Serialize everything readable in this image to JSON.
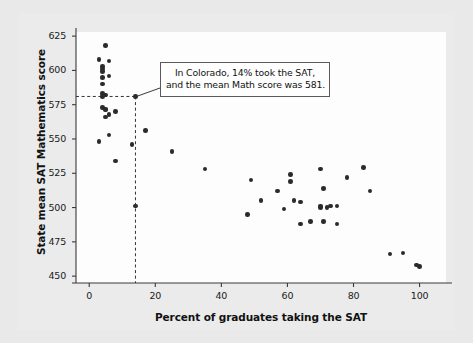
{
  "figure": {
    "background_color": "#e9e9e9",
    "panel_color": "#ebebeb",
    "plot_background_color": "#fdfdfd"
  },
  "annotation": {
    "name": "colorado-callout",
    "line1": "In Colorado, 14% took the SAT,",
    "line2": "and the mean Math score was 581.",
    "highlight_point": {
      "x": 14,
      "y": 581
    },
    "guide_style": "dashed",
    "guide_color": "#333333"
  },
  "chart_data": {
    "type": "scatter",
    "title": "",
    "xlabel": "Percent of graduates taking the SAT",
    "ylabel": "State mean SAT Mathematics score",
    "xlim": [
      -4,
      108
    ],
    "ylim": [
      445,
      628
    ],
    "xticks": [
      0,
      20,
      40,
      60,
      80,
      100
    ],
    "yticks": [
      450,
      475,
      500,
      525,
      550,
      575,
      600,
      625
    ],
    "grid": false,
    "legend": null,
    "marker_color": "#2b2b2b",
    "points": [
      {
        "x": 5,
        "y": 618
      },
      {
        "x": 3,
        "y": 608
      },
      {
        "x": 6,
        "y": 607
      },
      {
        "x": 4,
        "y": 603
      },
      {
        "x": 4,
        "y": 601
      },
      {
        "x": 4,
        "y": 599
      },
      {
        "x": 6,
        "y": 596
      },
      {
        "x": 4,
        "y": 595
      },
      {
        "x": 4,
        "y": 590
      },
      {
        "x": 4,
        "y": 583
      },
      {
        "x": 5,
        "y": 582
      },
      {
        "x": 4,
        "y": 581
      },
      {
        "x": 14,
        "y": 581
      },
      {
        "x": 4,
        "y": 573
      },
      {
        "x": 5,
        "y": 572
      },
      {
        "x": 5,
        "y": 571
      },
      {
        "x": 8,
        "y": 570
      },
      {
        "x": 6,
        "y": 568
      },
      {
        "x": 5,
        "y": 566
      },
      {
        "x": 17,
        "y": 556
      },
      {
        "x": 6,
        "y": 553
      },
      {
        "x": 3,
        "y": 548
      },
      {
        "x": 13,
        "y": 546
      },
      {
        "x": 25,
        "y": 541
      },
      {
        "x": 8,
        "y": 534
      },
      {
        "x": 83,
        "y": 529
      },
      {
        "x": 35,
        "y": 528
      },
      {
        "x": 70,
        "y": 528
      },
      {
        "x": 61,
        "y": 524
      },
      {
        "x": 78,
        "y": 522
      },
      {
        "x": 49,
        "y": 520
      },
      {
        "x": 61,
        "y": 519
      },
      {
        "x": 71,
        "y": 514
      },
      {
        "x": 57,
        "y": 512
      },
      {
        "x": 85,
        "y": 512
      },
      {
        "x": 52,
        "y": 505
      },
      {
        "x": 62,
        "y": 505
      },
      {
        "x": 64,
        "y": 504
      },
      {
        "x": 14,
        "y": 501
      },
      {
        "x": 70,
        "y": 501
      },
      {
        "x": 73,
        "y": 501
      },
      {
        "x": 75,
        "y": 501
      },
      {
        "x": 70,
        "y": 500
      },
      {
        "x": 72,
        "y": 500
      },
      {
        "x": 59,
        "y": 499
      },
      {
        "x": 48,
        "y": 495
      },
      {
        "x": 67,
        "y": 490
      },
      {
        "x": 71,
        "y": 490
      },
      {
        "x": 64,
        "y": 488
      },
      {
        "x": 75,
        "y": 488
      },
      {
        "x": 91,
        "y": 466
      },
      {
        "x": 95,
        "y": 467
      },
      {
        "x": 99,
        "y": 458
      },
      {
        "x": 100,
        "y": 457
      }
    ]
  }
}
